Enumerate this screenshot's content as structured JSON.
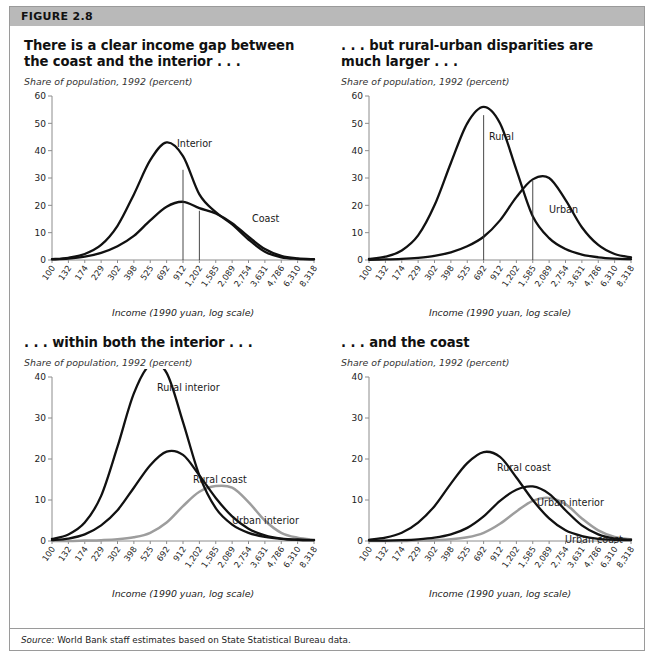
{
  "figure": {
    "number_label": "FIGURE 2.8",
    "source_prefix": "Source:",
    "source_text": "World Bank staff estimates based on State Statistical Bureau data."
  },
  "axis": {
    "y_title": "Share of population, 1992 (percent)",
    "x_title": "Income (1990 yuan, log scale)",
    "x_ticks": [
      "100",
      "132",
      "174",
      "229",
      "302",
      "398",
      "525",
      "692",
      "912",
      "1,202",
      "1,585",
      "2,089",
      "2,754",
      "3,631",
      "4,786",
      "6,310",
      "8,318"
    ],
    "y_ticks_60": [
      "0",
      "10",
      "20",
      "30",
      "40",
      "50",
      "60"
    ],
    "y_ticks_40": [
      "0",
      "10",
      "20",
      "30",
      "40"
    ]
  },
  "panels": [
    {
      "id": "coast-vs-interior",
      "title": "There is a clear income gap between the coast and the interior . . .",
      "subtitle": "Share of population, 1992 (percent)",
      "labels": [
        {
          "name": "Interior",
          "x": 157,
          "y": 59
        },
        {
          "name": "Coast",
          "x": 232,
          "y": 134
        }
      ]
    },
    {
      "id": "rural-vs-urban",
      "title": ". . . but rural-urban disparities are much larger . . .",
      "subtitle": "Share of population, 1992 (percent)",
      "labels": [
        {
          "name": "Rural",
          "x": 152,
          "y": 52
        },
        {
          "name": "Urban",
          "x": 212,
          "y": 125
        }
      ]
    },
    {
      "id": "within-interior",
      "title": ". . . within both the interior . . .",
      "subtitle": "Share of population, 1992 (percent)",
      "labels": [
        {
          "name": "Rural interior",
          "x": 137,
          "y": 22
        },
        {
          "name": "Rural coast",
          "x": 173,
          "y": 114
        },
        {
          "name": "Urban interior",
          "x": 212,
          "y": 155
        }
      ]
    },
    {
      "id": "within-coast",
      "title": ". . . and the coast",
      "subtitle": "Share of population, 1992 (percent)",
      "labels": [
        {
          "name": "Rural coast",
          "x": 160,
          "y": 102
        },
        {
          "name": "Urban interior",
          "x": 200,
          "y": 137
        },
        {
          "name": "Urban coast",
          "x": 228,
          "y": 174
        }
      ]
    }
  ],
  "colors": {
    "band": "#b9b9b9",
    "dark_curve": "#111111",
    "gray_curve": "#9d9d9d",
    "axis": "#8c8c8c",
    "frame": "#9a9a9a"
  },
  "chart_data": [
    {
      "type": "line",
      "panel": "coast-vs-interior",
      "title": "There is a clear income gap between the coast and the interior . . .",
      "xlabel": "Income (1990 yuan, log scale)",
      "ylabel": "Share of population, 1992 (percent)",
      "xscale": "log",
      "xlim": [
        100,
        8318
      ],
      "ylim": [
        0,
        60
      ],
      "grid": false,
      "legend": "inline-annotations",
      "x": [
        100,
        132,
        174,
        229,
        302,
        398,
        525,
        692,
        912,
        1202,
        1585,
        2089,
        2754,
        3631,
        4786,
        6310,
        8318
      ],
      "series": [
        {
          "name": "Interior",
          "color": "#111111",
          "values": [
            0.3,
            0.8,
            2.2,
            5.5,
            12.5,
            24.0,
            36.5,
            43.0,
            38.0,
            24.0,
            17.5,
            13.0,
            7.5,
            3.0,
            1.0,
            0.4,
            0.2
          ],
          "median_line_x": 912,
          "median_line_y": 33.0
        },
        {
          "name": "Coast",
          "color": "#111111",
          "values": [
            0.2,
            0.5,
            1.2,
            2.6,
            5.0,
            8.8,
            14.5,
            19.5,
            21.3,
            19.0,
            17.0,
            13.5,
            8.5,
            4.0,
            1.5,
            0.6,
            0.3
          ],
          "median_line_x": 1202,
          "median_line_y": 18.0
        }
      ]
    },
    {
      "type": "line",
      "panel": "rural-vs-urban",
      "title": ". . . but rural-urban disparities are much larger . . .",
      "xlabel": "Income (1990 yuan, log scale)",
      "ylabel": "Share of population, 1992 (percent)",
      "xscale": "log",
      "xlim": [
        100,
        8318
      ],
      "ylim": [
        0,
        60
      ],
      "grid": false,
      "legend": "inline-annotations",
      "x": [
        100,
        132,
        174,
        229,
        302,
        398,
        525,
        692,
        912,
        1202,
        1585,
        2089,
        2754,
        3631,
        4786,
        6310,
        8318
      ],
      "series": [
        {
          "name": "Rural",
          "color": "#111111",
          "values": [
            0.4,
            1.2,
            3.5,
            9.0,
            20.0,
            35.5,
            50.0,
            56.0,
            50.0,
            33.0,
            16.0,
            8.0,
            4.0,
            2.0,
            1.0,
            0.5,
            0.3
          ],
          "median_line_x": 692,
          "median_line_y": 53.0
        },
        {
          "name": "Urban",
          "color": "#111111",
          "values": [
            0.1,
            0.2,
            0.4,
            0.8,
            1.5,
            2.8,
            5.0,
            8.5,
            14.5,
            23.0,
            29.5,
            30.0,
            22.0,
            12.0,
            5.5,
            2.2,
            1.0
          ],
          "median_line_x": 1585,
          "median_line_y": 29.0
        }
      ]
    },
    {
      "type": "line",
      "panel": "within-interior",
      "title": ". . . within both the interior . . .",
      "xlabel": "Income (1990 yuan, log scale)",
      "ylabel": "Share of population, 1992 (percent)",
      "xscale": "log",
      "xlim": [
        100,
        8318
      ],
      "ylim": [
        0,
        40
      ],
      "grid": false,
      "legend": "inline-annotations",
      "x": [
        100,
        132,
        174,
        229,
        302,
        398,
        525,
        692,
        912,
        1202,
        1585,
        2089,
        2754,
        3631,
        4786,
        6310,
        8318
      ],
      "series": [
        {
          "name": "Rural interior",
          "color": "#111111",
          "values": [
            0.5,
            1.6,
            4.5,
            11.0,
            23.0,
            36.0,
            43.0,
            41.0,
            29.0,
            16.0,
            8.0,
            4.0,
            2.0,
            1.0,
            0.5,
            0.3,
            0.2
          ]
        },
        {
          "name": "Rural coast",
          "color": "#111111",
          "values": [
            0.2,
            0.6,
            1.6,
            3.8,
            7.5,
            13.0,
            18.5,
            21.8,
            21.0,
            16.0,
            10.5,
            6.0,
            3.0,
            1.4,
            0.6,
            0.3,
            0.2
          ]
        },
        {
          "name": "Urban interior",
          "color": "#9d9d9d",
          "values": [
            0.0,
            0.0,
            0.1,
            0.2,
            0.4,
            0.9,
            2.0,
            4.5,
            8.5,
            12.0,
            13.4,
            13.0,
            9.5,
            5.0,
            2.0,
            0.8,
            0.3
          ]
        }
      ]
    },
    {
      "type": "line",
      "panel": "within-coast",
      "title": ". . . and the coast",
      "xlabel": "Income (1990 yuan, log scale)",
      "ylabel": "Share of population, 1992 (percent)",
      "xscale": "log",
      "xlim": [
        100,
        8318
      ],
      "ylim": [
        0,
        40
      ],
      "grid": false,
      "legend": "inline-annotations",
      "x": [
        100,
        132,
        174,
        229,
        302,
        398,
        525,
        692,
        912,
        1202,
        1585,
        2089,
        2754,
        3631,
        4786,
        6310,
        8318
      ],
      "series": [
        {
          "name": "Rural coast",
          "color": "#111111",
          "values": [
            0.3,
            0.8,
            2.0,
            4.5,
            8.5,
            14.0,
            19.0,
            21.7,
            20.5,
            15.5,
            10.0,
            5.5,
            2.6,
            1.2,
            0.5,
            0.3,
            0.2
          ]
        },
        {
          "name": "Urban interior",
          "color": "#111111",
          "values": [
            0.1,
            0.1,
            0.2,
            0.4,
            0.8,
            1.6,
            3.2,
            6.0,
            9.8,
            12.5,
            13.3,
            11.5,
            7.5,
            3.8,
            1.6,
            0.6,
            0.3
          ]
        },
        {
          "name": "Urban coast",
          "color": "#9d9d9d",
          "values": [
            0.0,
            0.0,
            0.0,
            0.1,
            0.2,
            0.4,
            0.9,
            2.0,
            4.2,
            7.2,
            9.8,
            10.5,
            9.0,
            5.5,
            2.6,
            1.0,
            0.4
          ]
        }
      ]
    }
  ]
}
